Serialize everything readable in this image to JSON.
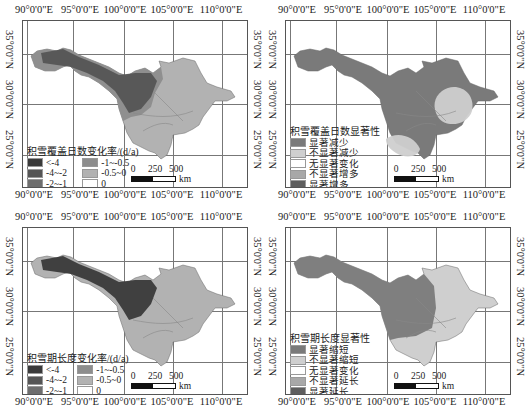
{
  "axes": {
    "lon_labels": [
      "90°0'0\"E",
      "95°0'0\"E",
      "100°0'0\"E",
      "105°0'0\"E",
      "110°0'0\"E"
    ],
    "lat_labels": [
      "35°0'0\"N",
      "30°0'0\"N",
      "25°0'0\"N"
    ]
  },
  "scale_bar": {
    "ticks": [
      "0",
      "250",
      "500"
    ],
    "unit": "km"
  },
  "colors": {
    "dark1": "#3a3a3a",
    "dark2": "#555555",
    "mid": "#6e6e6e",
    "light1": "#8d8d8d",
    "light2": "#b2b2b2",
    "white": "#ffffff",
    "sig_dec": "#7a7a7a",
    "nonsig_dec": "#cfcfcf",
    "nonsig_inc": "#a8a8a8",
    "sig_inc": "#5e5e5e"
  },
  "panels": [
    {
      "id": "a",
      "legend": {
        "title": "积雪覆盖日数变化率/(d/a)",
        "items": [
          {
            "label": "<-4",
            "color": "#3a3a3a"
          },
          {
            "label": "-1~-0.5",
            "color": "#8d8d8d"
          },
          {
            "label": "-4~-2",
            "color": "#555555"
          },
          {
            "label": "-0.5~0",
            "color": "#b2b2b2"
          },
          {
            "label": "-2~-1",
            "color": "#6e6e6e"
          },
          {
            "label": "0",
            "color": "#ffffff"
          }
        ]
      }
    },
    {
      "id": "b",
      "legend": {
        "title": "积雪覆盖日数显著性",
        "items": [
          {
            "label": "显著减少",
            "color": "#7a7a7a"
          },
          {
            "label": "不显著减少",
            "color": "#cfcfcf"
          },
          {
            "label": "无显著变化",
            "color": "#ffffff"
          },
          {
            "label": "不显著增多",
            "color": "#a8a8a8"
          },
          {
            "label": "显著增多",
            "color": "#5e5e5e"
          }
        ]
      }
    },
    {
      "id": "c",
      "legend": {
        "title": "积雪期长度变化率/(d/a)",
        "items": [
          {
            "label": "<-4",
            "color": "#3a3a3a"
          },
          {
            "label": "-1~-0.5",
            "color": "#8d8d8d"
          },
          {
            "label": "-4~-2",
            "color": "#555555"
          },
          {
            "label": "-0.5~0",
            "color": "#b2b2b2"
          },
          {
            "label": "-2~-1",
            "color": "#6e6e6e"
          },
          {
            "label": "0",
            "color": "#ffffff"
          }
        ]
      }
    },
    {
      "id": "d",
      "legend": {
        "title": "积雪期长度显著性",
        "items": [
          {
            "label": "显著缩短",
            "color": "#7a7a7a"
          },
          {
            "label": "不显著缩短",
            "color": "#cfcfcf"
          },
          {
            "label": "无显著变化",
            "color": "#ffffff"
          },
          {
            "label": "不显著延长",
            "color": "#a8a8a8"
          },
          {
            "label": "显著延长",
            "color": "#5e5e5e"
          }
        ]
      }
    }
  ]
}
